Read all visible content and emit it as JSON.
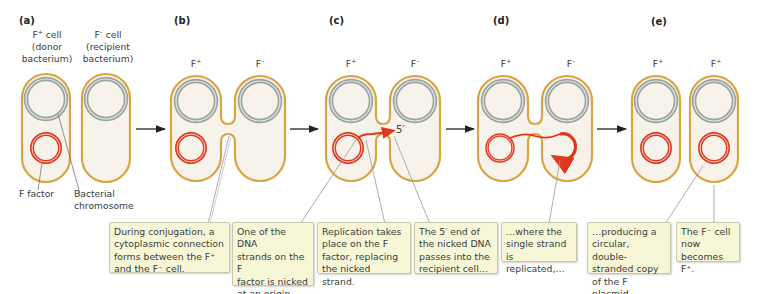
{
  "panels": [
    {
      "letter": "(a)",
      "cell_labels": [
        {
          "name": "F",
          "sup": "+",
          "rest": " cell",
          "line2": "(donor",
          "line3": "bacterium)"
        },
        {
          "name": "F",
          "sup": "–",
          "rest": " cell",
          "line2": "(recipient",
          "line3": "bacterium)"
        }
      ],
      "annotations": {
        "f_factor": "F factor",
        "chromosome_line1": "Bacterial",
        "chromosome_line2": "chromosome"
      }
    },
    {
      "letter": "(b)",
      "cell_labels": [
        {
          "name": "F",
          "sup": "+"
        },
        {
          "name": "F",
          "sup": "–"
        }
      ],
      "caption": "During conjugation, a\ncytoplasmic connection\nforms between the F⁺\nand the F⁻ cell."
    },
    {
      "letter": "(c)",
      "cell_labels": [
        {
          "name": "F",
          "sup": "+"
        },
        {
          "name": "F",
          "sup": "–"
        }
      ],
      "end_label": "5′",
      "captions": [
        "One of the DNA\nstrands on the F\nfactor is nicked\nat an origin\nand separates.",
        "Replication takes\nplace on the F\nfactor, replacing\nthe nicked strand.",
        "The 5′ end of\nthe nicked DNA\npasses into the\nrecipient cell…"
      ]
    },
    {
      "letter": "(d)",
      "cell_labels": [
        {
          "name": "F",
          "sup": "+"
        },
        {
          "name": "F",
          "sup": "–"
        }
      ],
      "caption": "…where the\nsingle strand\nis replicated,…"
    },
    {
      "letter": "(e)",
      "cell_labels": [
        {
          "name": "F",
          "sup": "+"
        },
        {
          "name": "F",
          "sup": "+"
        }
      ],
      "captions": [
        "…producing a\ncircular, double-\nstranded copy\nof the F plasmid.",
        "The F⁻ cell\nnow\nbecomes F⁺."
      ]
    }
  ],
  "colors": {
    "membrane": "#d9a441",
    "cytoplasm": "#f7f3ea",
    "chromosome": "#9aa39e",
    "f_factor": "#e0381f",
    "caption_bg": "#f7f7d8",
    "leader_line": "#9a9a9a",
    "arrow": "#222222"
  }
}
